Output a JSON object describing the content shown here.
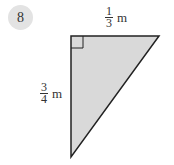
{
  "problem": {
    "number": "8"
  },
  "figure": {
    "shape": "right-triangle",
    "fill_color": "#d9d9d9",
    "stroke_color": "#222222",
    "top_side": {
      "numerator": "1",
      "denominator": "3",
      "unit": "m"
    },
    "left_side": {
      "numerator": "3",
      "denominator": "4",
      "unit": "m"
    }
  }
}
